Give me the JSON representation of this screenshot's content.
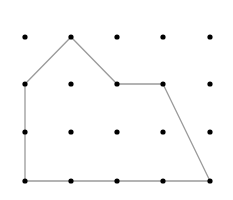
{
  "diagram": {
    "type": "dot-grid-polygon",
    "grid": {
      "columns": 5,
      "rows": 4,
      "x_positions": [
        25,
        71,
        117,
        163,
        210
      ],
      "y_positions": [
        37,
        84,
        132,
        181
      ],
      "dot_radius": 2.6,
      "dot_color": "#000000"
    },
    "polygon": {
      "vertices_grid": [
        [
          0,
          1
        ],
        [
          1,
          0
        ],
        [
          2,
          1
        ],
        [
          3,
          1
        ],
        [
          4,
          3
        ],
        [
          0,
          3
        ]
      ],
      "stroke_color": "#9a9a9a",
      "stroke_width": 1.3
    }
  }
}
